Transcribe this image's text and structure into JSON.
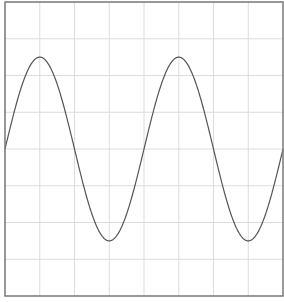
{
  "chart_data": {
    "type": "line",
    "title": "",
    "xlabel": "",
    "ylabel": "",
    "grid": true,
    "legend": null,
    "function": "y = sin(x)",
    "periods": 2,
    "grid_divisions": {
      "x": 8,
      "y": 8
    },
    "xlim": [
      0,
      12.566
    ],
    "ylim": [
      -1.6,
      1.6
    ],
    "series": [
      {
        "name": "sine",
        "color": "#555555",
        "x": [
          0,
          1.5708,
          3.1416,
          4.7124,
          6.2832,
          7.854,
          9.4248,
          10.9956,
          12.5664
        ],
        "values": [
          0,
          1,
          0,
          -1,
          0,
          1,
          0,
          -1,
          0
        ]
      }
    ]
  },
  "style": {
    "frame_color": "#777777",
    "grid_color": "#dcdcdc",
    "line_color": "#555555",
    "background": "#ffffff"
  }
}
